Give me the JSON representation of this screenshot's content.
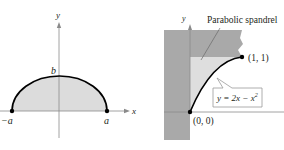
{
  "figures": [
    {
      "id": "half-ellipse",
      "labels": {
        "y_axis": "y",
        "x_axis": "x",
        "top_vertex": "b",
        "left_vertex": "−a",
        "right_vertex": "a"
      },
      "colors": {
        "fill": "#dcdcdc",
        "curve": "#000000",
        "axis": "#8a8a8a"
      }
    },
    {
      "id": "parabolic-spandrel",
      "labels": {
        "y_axis": "y",
        "title_callout": "Parabolic spandrel",
        "point_end": "(1, 1)",
        "point_origin": "(0, 0)",
        "equation_prefix": "y = 2x − x",
        "equation_exponent": "2"
      },
      "colors": {
        "wall": "#a9a9a9",
        "spandrel": "#dedede",
        "curve": "#000000",
        "callout_border": "#9a9a9a"
      }
    }
  ]
}
